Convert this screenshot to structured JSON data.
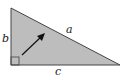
{
  "diagram": {
    "type": "right-triangle",
    "fill_color": "#bdbdbd",
    "stroke_color": "#444444",
    "labels": {
      "hypotenuse": "a",
      "vertical_leg": "b",
      "horizontal_leg": "c"
    },
    "right_angle_marker": "bottom-left",
    "arrow": "pointing toward hypotenuse"
  }
}
